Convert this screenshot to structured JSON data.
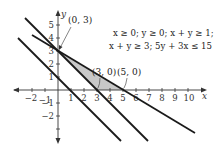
{
  "figure": {
    "x_axis_label": "x",
    "y_axis_label": "y",
    "x_ticks": [
      "−2",
      "−1",
      "1",
      "2",
      "3",
      "4",
      "5",
      "6",
      "7",
      "8",
      "9",
      "10"
    ],
    "y_ticks": [
      "5",
      "4",
      "3",
      "2",
      "1",
      "−1",
      "−2"
    ],
    "inequalities": {
      "line1": "x ≥ 0; y ≥ 0; x + y ≥ 1;",
      "line2": "x + y ≥ 3; 5y + 3x ≤ 15"
    },
    "point_labels": {
      "p1": "(0, 3)",
      "p2": "(3, 0)",
      "p3": "(5, 0)"
    },
    "lines": [
      {
        "equation": "x + y = 1"
      },
      {
        "equation": "x + y = 3"
      },
      {
        "equation": "5y + 3x = 15"
      }
    ],
    "feasible_region": {
      "vertices": [
        [
          0,
          3
        ],
        [
          3,
          0
        ],
        [
          5,
          0
        ]
      ],
      "fill_color": "#c8c8c8"
    },
    "colors": {
      "line": "#1a1a1a",
      "axis": "#333333"
    }
  }
}
